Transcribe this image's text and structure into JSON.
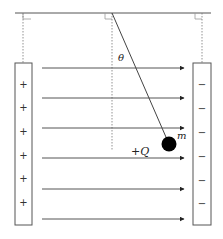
{
  "diagram": {
    "labels": {
      "angle": "θ",
      "mass": "m",
      "charge": "+Q"
    },
    "left_plate": {
      "signs": [
        "+",
        "+",
        "+",
        "+",
        "+",
        "+"
      ]
    },
    "right_plate": {
      "signs": [
        "−",
        "−",
        "−",
        "−",
        "−",
        "−"
      ]
    },
    "field_arrows": 6,
    "colors": {
      "line": "#333333",
      "arrow": "#444444",
      "dotted": "#777777",
      "ball": "#000000"
    }
  }
}
